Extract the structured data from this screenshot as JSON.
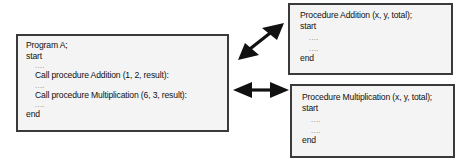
{
  "program_box": {
    "lines": {
      "header": "Program A;",
      "start": "start",
      "dots1": "....",
      "call_add": "Call procedure Addition (1, 2, result):",
      "dots2": "....",
      "call_mul": "Call procedure Multiplication (6, 3, result):",
      "dots3": "....",
      "end": "end"
    }
  },
  "addition_box": {
    "lines": {
      "header": "Procedure Addition (x, y, total);",
      "start": "start",
      "dots1": "....",
      "dots2": "....",
      "end": "end"
    }
  },
  "multiplication_box": {
    "lines": {
      "header": "Procedure Multiplication (x, y, total);",
      "start": "start",
      "dots1": "....",
      "dots2": "....",
      "end": "end"
    }
  },
  "arrows": [
    {
      "from": "program_box",
      "to": "addition_box",
      "style": "double-headed",
      "direction": "diagonal"
    },
    {
      "from": "program_box",
      "to": "multiplication_box",
      "style": "double-headed",
      "direction": "horizontal"
    }
  ],
  "colors": {
    "box_fill": "#f4f4f4",
    "box_border": "#3a3a3a",
    "arrow": "#111111",
    "text": "#111111"
  }
}
